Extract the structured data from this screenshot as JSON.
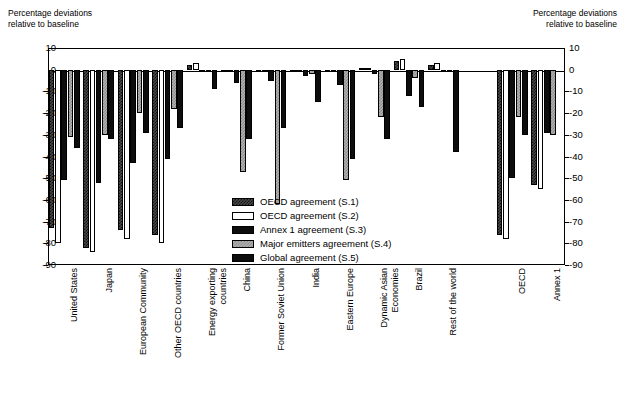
{
  "axis_caption_left": "Percentage deviations\nrelative to baseline",
  "axis_caption_right": "Percentage deviations\nrelative to baseline",
  "chart_data": {
    "type": "bar",
    "title": "",
    "xlabel": "",
    "ylabel": "Percentage deviations relative to baseline",
    "ylim": [
      -90,
      10
    ],
    "yticks": [
      10,
      0,
      -10,
      -20,
      -30,
      -40,
      -50,
      -60,
      -70,
      -80,
      -90
    ],
    "ytick_labels": [
      "10",
      "0",
      "-10",
      "-20",
      "-30",
      "-40",
      "-50",
      "-60",
      "-70",
      "-80",
      "-90"
    ],
    "grid": false,
    "legend_position": "inside-center-right",
    "categories": [
      "United States",
      "Japan",
      "European Community",
      "Other OECD countries",
      "Energy exporting\ncountries",
      "China",
      "Former Soviet Union",
      "India",
      "Eastern Europe",
      "Dynamic Asian\nEconomies",
      "Brazil",
      "Rest of the world",
      "",
      "OECD",
      "Annex 1"
    ],
    "series": [
      {
        "name": "OECD agreement (S.1)",
        "key": "s1",
        "color": "#4a4a4a",
        "pattern": "dark-checker",
        "values": [
          -73,
          -82,
          -74,
          -76,
          2,
          -1,
          -1,
          -1,
          -1,
          1,
          4,
          2,
          null,
          -76,
          -53
        ]
      },
      {
        "name": "OECD agreement (S.2)",
        "key": "s2",
        "color": "#ffffff",
        "pattern": "open",
        "values": [
          -80,
          -84,
          -78,
          -80,
          3,
          -1,
          -1,
          -1,
          -1,
          1,
          5,
          3,
          null,
          -78,
          -55
        ]
      },
      {
        "name": "Annex 1 agreement (S.3)",
        "key": "s3",
        "color": "#0d0d0d",
        "pattern": "solid-black",
        "values": [
          -51,
          -52,
          -43,
          -41,
          -1,
          -6,
          -5,
          -3,
          -7,
          -2,
          -12,
          -1,
          null,
          -50,
          -29
        ]
      },
      {
        "name": "Major emitters agreement (S.4)",
        "key": "s4",
        "color": "#b0b0b0",
        "pattern": "light-checker",
        "values": [
          -31,
          -30,
          -20,
          -18,
          -1,
          -47,
          -62,
          -2,
          -51,
          -22,
          -4,
          -1,
          null,
          -22,
          -30
        ]
      },
      {
        "name": "Global agreement (S.5)",
        "key": "s5",
        "color": "#0d0d0d",
        "pattern": "solid-black",
        "values": [
          -36,
          -32,
          -29,
          -27,
          -9,
          -32,
          -27,
          -15,
          -41,
          -32,
          -17,
          -38,
          null,
          -30,
          null
        ]
      }
    ]
  },
  "legend": {
    "items": [
      {
        "label": "OECD agreement (S.1)",
        "swatch": "s1"
      },
      {
        "label": "OECD agreement (S.2)",
        "swatch": "s2"
      },
      {
        "label": "Annex 1 agreement (S.3)",
        "swatch": "s3"
      },
      {
        "label": "Major emitters agreement (S.4)",
        "swatch": "s4"
      },
      {
        "label": "Global agreement (S.5)",
        "swatch": "s5"
      }
    ]
  }
}
